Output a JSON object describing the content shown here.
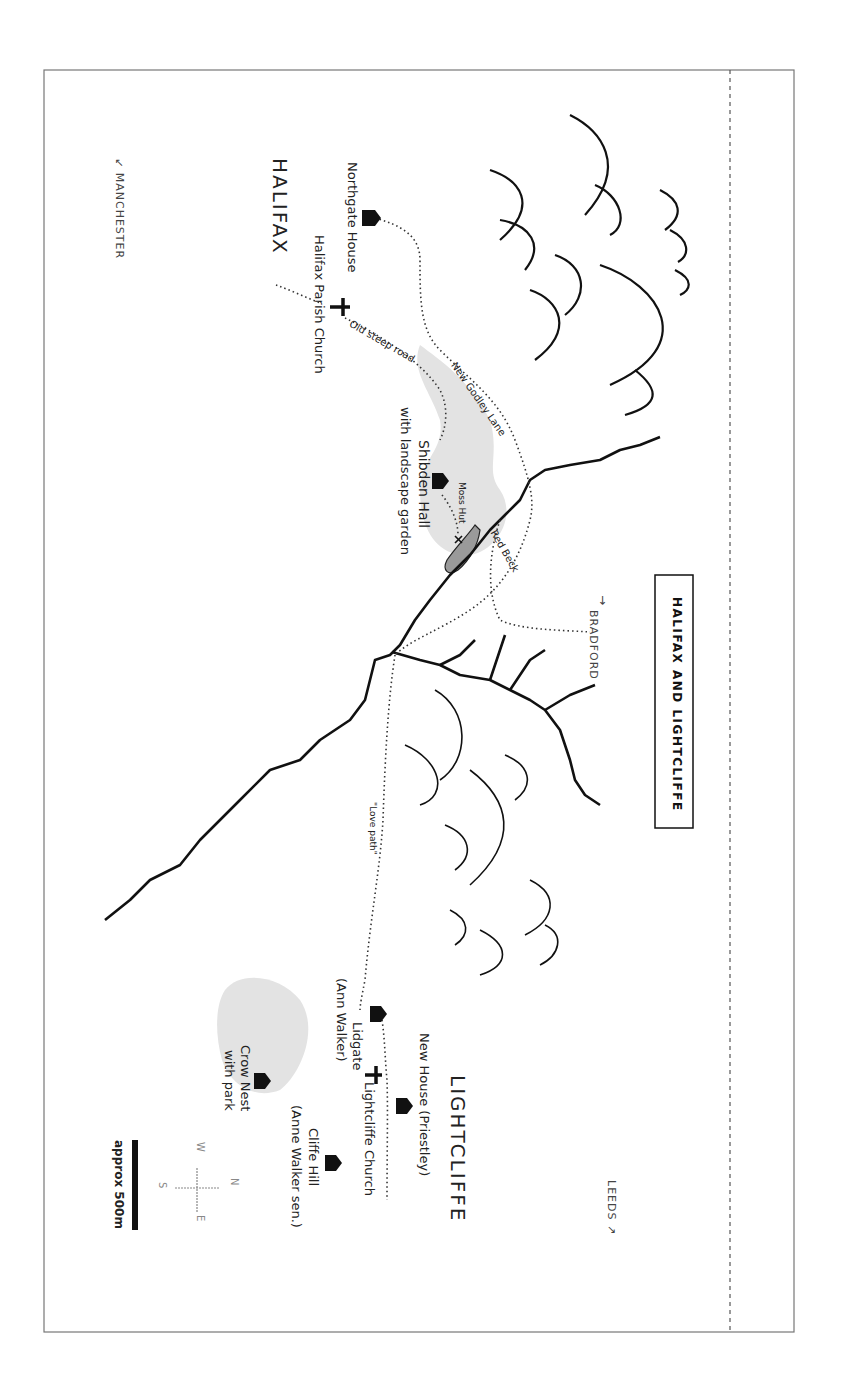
{
  "map": {
    "title": "HALIFAX AND LIGHTCLIFFE",
    "towns": {
      "halifax": "HALIFAX",
      "lightcliffe": "LIGHTCLIFFE"
    },
    "directions": {
      "manchester": "↙ MANCHESTER",
      "bradford": "BRADFORD",
      "bradford_arrow": "→",
      "leeds": "LEEDS ↗"
    },
    "places": {
      "northgate_house": "Northgate House",
      "halifax_parish_church": "Halifax Parish Church",
      "shibden_hall": "Shibden Hall",
      "shibden_hall_sub": "with landscape garden",
      "moss_hut": "Moss Hut",
      "lidgate": "Lidgate",
      "lidgate_sub": "(Ann Walker)",
      "new_house": "New House (Priestley)",
      "lightcliffe_church": "Lightcliffe Church",
      "cliffe_hill": "Cliffe Hill",
      "cliffe_hill_sub": "(Anne Walker sen.)",
      "crow_nest": "Crow Nest",
      "crow_nest_sub": "with park"
    },
    "routes": {
      "old_steep_road": "Old steep road",
      "new_godley_lane": "New Godley Lane",
      "red_beck": "Red Beck",
      "love_path": "\"Love path\""
    },
    "compass": {
      "n": "N",
      "s": "S",
      "e": "E",
      "w": "W"
    },
    "scale": "approx 500m",
    "colors": {
      "ink": "#111111",
      "park": "#e3e3e3",
      "pond": "#9a9a9a",
      "frame": "#777777",
      "compass": "#888888"
    }
  }
}
